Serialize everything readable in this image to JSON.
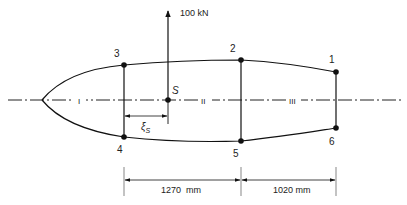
{
  "figure": {
    "force_label": "100 kN",
    "centroid_label": "S",
    "xi_label": "ξ",
    "xi_subscript": "S",
    "segment_labels": [
      "I",
      "II",
      "III"
    ],
    "points": [
      {
        "id": "1",
        "label": "1"
      },
      {
        "id": "2",
        "label": "2"
      },
      {
        "id": "3",
        "label": "3"
      },
      {
        "id": "4",
        "label": "4"
      },
      {
        "id": "5",
        "label": "5"
      },
      {
        "id": "6",
        "label": "6"
      }
    ],
    "dimensions": [
      {
        "label": "1270  mm",
        "value_mm": 1270
      },
      {
        "label": "1020 mm",
        "value_mm": 1020
      }
    ]
  }
}
